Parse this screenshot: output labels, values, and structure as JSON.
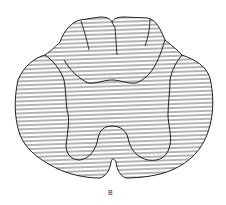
{
  "figure": {
    "label": "B",
    "colors": {
      "line": "#222222",
      "hatch": "#444444",
      "background": "#ffffff"
    }
  }
}
